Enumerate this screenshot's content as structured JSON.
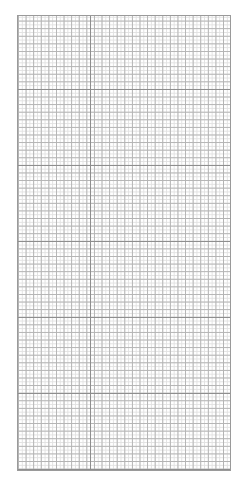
{
  "page": {
    "type": "graph-paper",
    "background_color": "#ffffff"
  },
  "grid": {
    "line_colors": {
      "major": "#8e8e8e",
      "medium": "#b4b4b4",
      "minor": "#e2e2e2",
      "border": "#9a9a9a"
    },
    "major_vertical_lines": [
      73
    ],
    "major_horizontal_spacing_px": 76,
    "medium_cell_px": 7.6,
    "minor_cell_px": 3.8
  }
}
